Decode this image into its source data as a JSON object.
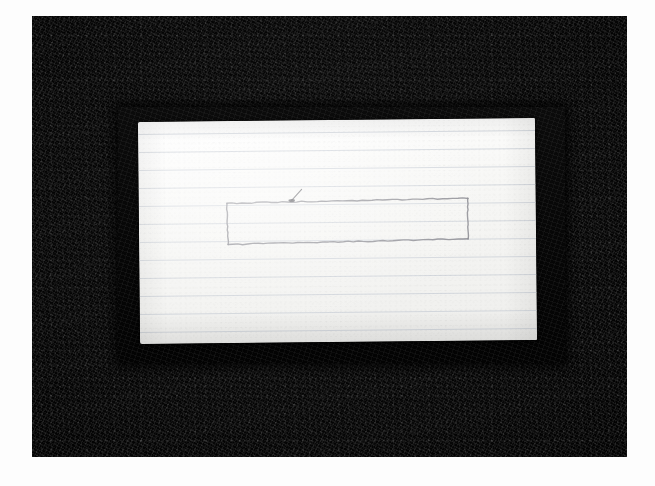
{
  "scene": {
    "title": "Photograph of ruled paper on dark cloth background",
    "width": 655,
    "height": 486,
    "page_background_color": "#ffffff"
  },
  "backdrop": {
    "name": "dark textured cloth backdrop",
    "color": "#070707",
    "rect": {
      "x": 32,
      "y": 16,
      "width": 595,
      "height": 441
    }
  },
  "inner_mat": {
    "name": "inner dark board beneath the sheet",
    "color": "#050505",
    "rect": {
      "x": 118,
      "y": 107,
      "width": 447,
      "height": 256
    }
  },
  "paper": {
    "name": "sheet of ruled notebook paper",
    "color": "#f7f7f5",
    "rule_line_color": "#c8cdd6",
    "rect": {
      "x": 139,
      "y": 120,
      "width": 397,
      "height": 222
    },
    "rotation_deg": -0.55,
    "rule_count": 12,
    "rule_spacing_px": 18,
    "rule_first_offset_px": 12,
    "text_content": ""
  },
  "drawing": {
    "name": "hand-drawn pencil rectangle",
    "stroke_color": "#8c8c92",
    "stroke_width_px": 1.4,
    "rect": {
      "x": 227,
      "y": 201,
      "width": 241,
      "height": 42
    },
    "start_mark": {
      "name": "pen start blob and tail",
      "x": 292,
      "y": 200,
      "tail_to_x": 302,
      "tail_to_y": 189,
      "color": "#4a4a50"
    }
  },
  "labels": {
    "scene_caption": "",
    "annotation": ""
  }
}
